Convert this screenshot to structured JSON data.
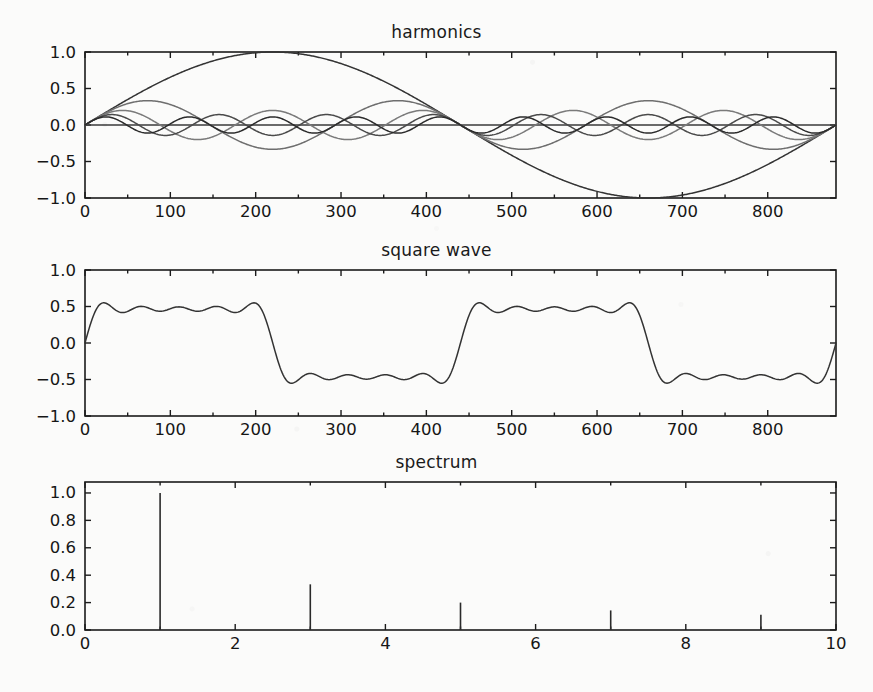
{
  "figure": {
    "background_color": "#fbfbfa",
    "axis_color": "#1b1b1b",
    "width": 873,
    "height": 692
  },
  "chart_data": [
    {
      "type": "line",
      "title": "harmonics",
      "xlabel": "",
      "ylabel": "",
      "xlim": [
        0,
        880
      ],
      "ylim": [
        -1.0,
        1.0
      ],
      "grid": false,
      "legend": "none",
      "xticks": [
        0,
        100,
        200,
        300,
        400,
        500,
        600,
        700,
        800
      ],
      "xticklabels": [
        "0",
        "100",
        "200",
        "300",
        "400",
        "500",
        "600",
        "700",
        "800"
      ],
      "yticks": [
        -1.0,
        -0.5,
        0.0,
        0.5,
        1.0
      ],
      "yticklabels": [
        "−1.0",
        "−0.5",
        "0.0",
        "0.5",
        "1.0"
      ],
      "description": "Odd sine harmonics of a square wave, amplitude 1/n, period 880/n samples",
      "series": [
        {
          "name": "harmonic 1",
          "harmonic": 1,
          "amplitude": 1.0,
          "color": "#333333"
        },
        {
          "name": "harmonic 3",
          "harmonic": 3,
          "amplitude": 0.33333,
          "color": "#6e6e6e"
        },
        {
          "name": "harmonic 5",
          "harmonic": 5,
          "amplitude": 0.2,
          "color": "#7a7a7a"
        },
        {
          "name": "harmonic 7",
          "harmonic": 7,
          "amplitude": 0.14286,
          "color": "#4a4a4a"
        },
        {
          "name": "harmonic 9",
          "harmonic": 9,
          "amplitude": 0.11111,
          "color": "#2b2b2b"
        }
      ]
    },
    {
      "type": "line",
      "title": "square wave",
      "xlabel": "",
      "ylabel": "",
      "xlim": [
        0,
        880
      ],
      "ylim": [
        -1.0,
        1.0
      ],
      "grid": false,
      "legend": "none",
      "xticks": [
        0,
        100,
        200,
        300,
        400,
        500,
        600,
        700,
        800
      ],
      "xticklabels": [
        "0",
        "100",
        "200",
        "300",
        "400",
        "500",
        "600",
        "700",
        "800"
      ],
      "yticks": [
        -1.0,
        -0.5,
        0.0,
        0.5,
        1.0
      ],
      "yticklabels": [
        "−1.0",
        "−0.5",
        "0.0",
        "0.5",
        "1.0"
      ],
      "description": "Sum of the five odd harmonics (Gibbs ripple), period 440 samples",
      "series": [
        {
          "name": "sum of harmonics",
          "harmonics": [
            1,
            3,
            5,
            7,
            9
          ],
          "color": "#333333"
        }
      ]
    },
    {
      "type": "bar",
      "title": "spectrum",
      "xlabel": "",
      "ylabel": "",
      "xlim": [
        0,
        10
      ],
      "ylim": [
        0.0,
        1.08
      ],
      "grid": false,
      "legend": "none",
      "xticks": [
        0,
        2,
        4,
        6,
        8,
        10
      ],
      "xticklabels": [
        "0",
        "2",
        "4",
        "6",
        "8",
        "10"
      ],
      "yticks": [
        0.0,
        0.2,
        0.4,
        0.6,
        0.8,
        1.0
      ],
      "yticklabels": [
        "0.0",
        "0.2",
        "0.4",
        "0.6",
        "0.8",
        "1.0"
      ],
      "description": "Amplitude spectrum: 1/n at odd harmonic numbers",
      "categories": [
        1,
        3,
        5,
        7,
        9
      ],
      "values": [
        1.0,
        0.3333,
        0.2,
        0.1429,
        0.1111
      ],
      "stem_color": "#2a2a2a"
    }
  ]
}
